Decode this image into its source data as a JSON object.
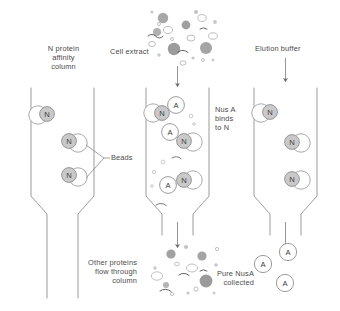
{
  "diagram": {
    "colors": {
      "stroke": "#8a8a8a",
      "text": "#4a4a4a",
      "bead_fill": "#ffffff",
      "n_fill": "#c9c9c9",
      "a_fill": "#ffffff",
      "protein_dark": "#9a9a9a",
      "protein_mid": "#bdbdbd",
      "protein_light": "#dedede"
    }
  },
  "labels": {
    "column1_title": "N protein\naffinity\ncolumn",
    "column2_title": "Cell extract",
    "column3_title": "Elution buffer",
    "beads": "Beads",
    "binds": "Nus A\nbinds\nto N",
    "flow_through": "Other proteins\nflow through\ncolumn",
    "collected": "Pure NusA\ncollected"
  },
  "glyphs": {
    "bead_letter": "N",
    "nusa_letter": "A"
  },
  "stages": [
    {
      "id": "stage-1",
      "name": "n-protein-affinity-column",
      "title_key": "column1_title",
      "column_x": 62,
      "beads": [
        {
          "x": 62,
          "y": 115,
          "side": "right"
        },
        {
          "x": 118,
          "y": 143,
          "side": "left"
        },
        {
          "x": 118,
          "y": 173,
          "side": "left"
        }
      ],
      "nusa": [],
      "input_arrow": false,
      "output_arrow": false,
      "particles": []
    },
    {
      "id": "stage-2",
      "name": "cell-extract-loading-column",
      "title_key": "column2_title",
      "column_x": 168,
      "beads": [
        {
          "x": 168,
          "y": 113,
          "side": "right"
        },
        {
          "x": 224,
          "y": 142,
          "side": "left"
        },
        {
          "x": 224,
          "y": 187,
          "side": "left"
        }
      ],
      "nusa": [
        {
          "x": 190,
          "y": 108
        },
        {
          "x": 186,
          "y": 142
        },
        {
          "x": 180,
          "y": 192
        }
      ],
      "input_arrow": true,
      "output_arrow": true,
      "particles": [
        "mixed-proteins"
      ]
    },
    {
      "id": "stage-3",
      "name": "elution-buffer-column",
      "title_key": "column3_title",
      "column_x": 276,
      "beads": [
        {
          "x": 276,
          "y": 113,
          "side": "right"
        },
        {
          "x": 332,
          "y": 143,
          "side": "left"
        },
        {
          "x": 332,
          "y": 180,
          "side": "left"
        }
      ],
      "nusa": [],
      "input_arrow": true,
      "output_arrow": true,
      "particles": []
    }
  ],
  "outputs": {
    "flow_through_particles": "other-proteins-cluster",
    "collected_nusa": [
      {
        "x": 215,
        "y": 261
      },
      {
        "x": 245,
        "y": 253
      },
      {
        "x": 240,
        "y": 280
      }
    ]
  }
}
